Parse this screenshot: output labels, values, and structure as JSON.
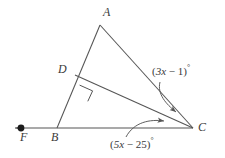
{
  "diagram": {
    "type": "euclidean-geometry-figure",
    "stroke_color": "#555555",
    "label_color": "#3a3a3a",
    "background_color": "#ffffff",
    "points": {
      "A": {
        "label": "A",
        "x": 100,
        "y": 25
      },
      "B": {
        "label": "B",
        "x": 57,
        "y": 128
      },
      "C": {
        "label": "C",
        "x": 193,
        "y": 128
      },
      "D": {
        "label": "D",
        "x": 75,
        "y": 75
      },
      "F": {
        "label": "F",
        "x": 21,
        "y": 128
      }
    },
    "segments": [
      {
        "name": "segment-AB",
        "from": "A",
        "to": "B"
      },
      {
        "name": "segment-AC",
        "from": "A",
        "to": "C"
      },
      {
        "name": "segment-DC",
        "from": "D",
        "to": "C"
      },
      {
        "name": "ray-FC",
        "from": "F",
        "to": "C"
      }
    ],
    "ray_arrow": {
      "name": "left-arrow",
      "direction": "left",
      "tip_x": 11,
      "tip_y": 128
    },
    "point_marker": {
      "name": "point-F-dot",
      "at": "F",
      "filled": true
    },
    "right_angle": {
      "name": "right-angle-at-D",
      "at": "D",
      "measure": "90"
    },
    "angles": [
      {
        "name": "angle-ACD",
        "vertex": "C",
        "expression_prefix": "(",
        "coefficient_term": "3x",
        "operator": "−",
        "constant": "1",
        "expression_suffix": ")",
        "degree_symbol": "°",
        "full_text": "(3x − 1)°"
      },
      {
        "name": "angle-DCB",
        "vertex": "C",
        "expression_prefix": "(",
        "coefficient_term": "5x",
        "operator": "−",
        "constant": "25",
        "expression_suffix": ")",
        "degree_symbol": "°",
        "full_text": "(5x − 25)°"
      }
    ]
  }
}
